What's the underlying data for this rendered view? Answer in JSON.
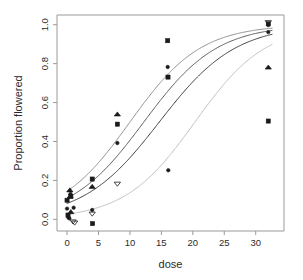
{
  "figure": {
    "kind": "scatter-with-fitted-logistic-curves",
    "background": "#ffffff",
    "box_color": "#9a9a9a",
    "ink_color": "#1a1a1a"
  },
  "chart_data": {
    "type": "scatter",
    "title": "",
    "subtitle": "",
    "xlabel": "dose",
    "ylabel": "Proportion flowered",
    "xlim": [
      -1.6,
      34.5
    ],
    "ylim": [
      -0.06,
      1.05
    ],
    "grid": false,
    "legend": "none",
    "xticks": [
      0,
      5,
      10,
      15,
      20,
      25,
      30
    ],
    "xtick_labels": [
      "0",
      "5",
      "10",
      "15",
      "20",
      "25",
      "30"
    ],
    "yticks": [
      0.0,
      0.2,
      0.4,
      0.6,
      0.8,
      1.0
    ],
    "ytick_labels": [
      "0.0",
      "0.2",
      "0.4",
      "0.6",
      "0.8",
      "1.0"
    ],
    "annotations": [],
    "series": [
      {
        "name": "observations-circle",
        "marker": "filled-circle",
        "marker_size": 3.0,
        "color": "#1a1a1a",
        "points": [
          {
            "x": 0.0,
            "y": 0.055
          },
          {
            "x": 0.2,
            "y": 0.01
          },
          {
            "x": 0.35,
            "y": 0.005
          },
          {
            "x": 0.55,
            "y": 0.13
          },
          {
            "x": 1.05,
            "y": 0.06
          },
          {
            "x": 4.0,
            "y": 0.048
          },
          {
            "x": 8.0,
            "y": 0.392
          },
          {
            "x": 16.0,
            "y": 0.783
          },
          {
            "x": 16.1,
            "y": 0.252
          },
          {
            "x": 32.0,
            "y": 0.962
          },
          {
            "x": 32.0,
            "y": 0.998
          }
        ]
      },
      {
        "name": "observations-square",
        "marker": "filled-square",
        "marker_size": 3.4,
        "color": "#1a1a1a",
        "points": [
          {
            "x": 0.0,
            "y": 0.098
          },
          {
            "x": 0.15,
            "y": 0.022
          },
          {
            "x": 0.6,
            "y": 0.118
          },
          {
            "x": 4.0,
            "y": 0.207
          },
          {
            "x": 4.05,
            "y": -0.022
          },
          {
            "x": 8.0,
            "y": 0.489
          },
          {
            "x": 16.0,
            "y": 0.918
          },
          {
            "x": 16.05,
            "y": 0.731
          },
          {
            "x": 32.0,
            "y": 0.505
          },
          {
            "x": 32.0,
            "y": 1.005
          }
        ]
      },
      {
        "name": "observations-triangle-up",
        "marker": "triangle-up",
        "marker_size": 3.6,
        "color": "#1a1a1a",
        "points": [
          {
            "x": 0.45,
            "y": 0.15
          },
          {
            "x": 0.5,
            "y": 0.118
          },
          {
            "x": 0.6,
            "y": 0.038
          },
          {
            "x": 4.0,
            "y": 0.168
          },
          {
            "x": 8.0,
            "y": 0.54
          },
          {
            "x": 32.0,
            "y": 0.781
          }
        ]
      },
      {
        "name": "observations-triangle-down",
        "marker": "triangle-down",
        "marker_size": 3.6,
        "color": "#8a8a8a",
        "points": [
          {
            "x": 0.95,
            "y": -0.012
          },
          {
            "x": 1.2,
            "y": -0.018
          },
          {
            "x": 4.0,
            "y": 0.028
          },
          {
            "x": 8.0,
            "y": 0.182
          },
          {
            "x": 32.0,
            "y": 1.012
          }
        ]
      }
    ],
    "fitted_curves": [
      {
        "name": "fit-curve-1-upper",
        "model": "logistic",
        "color": "#8f8f8f",
        "intercept": -1.78,
        "slope": 0.178,
        "y_at_x": [
          {
            "x": 0,
            "y": 0.144
          },
          {
            "x": 4,
            "y": 0.254
          },
          {
            "x": 8,
            "y": 0.406
          },
          {
            "x": 12,
            "y": 0.576
          },
          {
            "x": 16,
            "y": 0.729
          },
          {
            "x": 20,
            "y": 0.842
          },
          {
            "x": 24,
            "y": 0.912
          },
          {
            "x": 28,
            "y": 0.953
          },
          {
            "x": 32,
            "y": 0.976
          }
        ]
      },
      {
        "name": "fit-curve-2",
        "model": "logistic",
        "color": "#5a5a5a",
        "intercept": -2.1,
        "slope": 0.172,
        "y_at_x": [
          {
            "x": 0,
            "y": 0.109
          },
          {
            "x": 4,
            "y": 0.199
          },
          {
            "x": 8,
            "y": 0.336
          },
          {
            "x": 12,
            "y": 0.505
          },
          {
            "x": 16,
            "y": 0.672
          },
          {
            "x": 20,
            "y": 0.806
          },
          {
            "x": 24,
            "y": 0.893
          },
          {
            "x": 28,
            "y": 0.944
          },
          {
            "x": 32,
            "y": 0.971
          }
        ]
      },
      {
        "name": "fit-curve-3",
        "model": "logistic",
        "color": "#3c3c3c",
        "intercept": -2.42,
        "slope": 0.165,
        "y_at_x": [
          {
            "x": 0,
            "y": 0.082
          },
          {
            "x": 4,
            "y": 0.151
          },
          {
            "x": 8,
            "y": 0.265
          },
          {
            "x": 12,
            "y": 0.42
          },
          {
            "x": 16,
            "y": 0.593
          },
          {
            "x": 20,
            "y": 0.748
          },
          {
            "x": 24,
            "y": 0.858
          },
          {
            "x": 28,
            "y": 0.924
          },
          {
            "x": 32,
            "y": 0.96
          }
        ]
      },
      {
        "name": "fit-curve-4-lower",
        "model": "logistic",
        "color": "#c0c0c0",
        "intercept": -3.62,
        "slope": 0.178,
        "y_at_x": [
          {
            "x": 0,
            "y": 0.026
          },
          {
            "x": 4,
            "y": 0.052
          },
          {
            "x": 8,
            "y": 0.1
          },
          {
            "x": 12,
            "y": 0.185
          },
          {
            "x": 16,
            "y": 0.314
          },
          {
            "x": 20,
            "y": 0.478
          },
          {
            "x": 24,
            "y": 0.647
          },
          {
            "x": 28,
            "y": 0.784
          },
          {
            "x": 32,
            "y": 0.878
          }
        ]
      }
    ]
  }
}
